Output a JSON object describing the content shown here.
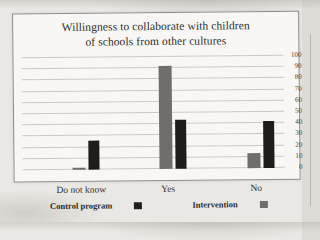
{
  "chart": {
    "title_line1": "Willingness to collaborate with children",
    "title_line2": "of schools from other cultures"
  },
  "chart_data": {
    "type": "bar",
    "title": "Willingness to collaborate with children of schools from other cultures",
    "categories": [
      "Do not know",
      "Yes",
      "No"
    ],
    "series": [
      {
        "name": "Control program",
        "color": "#1e1d1b",
        "values": [
          26,
          44,
          42
        ]
      },
      {
        "name": "Intervention",
        "color": "#6f6e6c",
        "values": [
          2,
          92,
          13
        ]
      }
    ],
    "xlabel": "",
    "ylabel": "",
    "ylim": [
      0,
      100
    ],
    "yticks": [
      0,
      10,
      20,
      30,
      40,
      50,
      60,
      70,
      80,
      90,
      100
    ],
    "ytick_side": "right",
    "grid": true,
    "legend_position": "bottom"
  }
}
